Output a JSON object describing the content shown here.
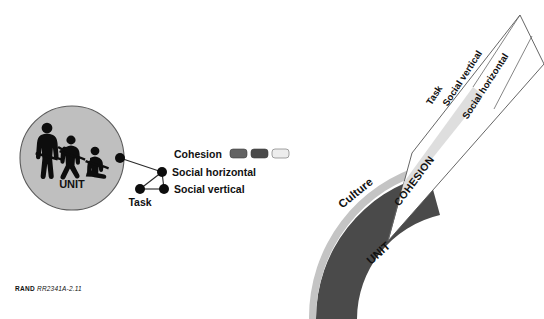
{
  "figure": {
    "caption_prefix": "RAND",
    "caption_id": "RR2341A-2.11"
  },
  "left_panel": {
    "unit_circle": {
      "label": "UNIT",
      "fill_color": "#bfbfbf",
      "stroke_color": "#555555",
      "icons": [
        "soldier-standing-icon",
        "soldier-running-icon",
        "soldier-kneeling-icon"
      ]
    },
    "legend": {
      "title": "Cohesion",
      "swatches": [
        {
          "name": "task-swatch",
          "color": "#636363"
        },
        {
          "name": "social-vertical-swatch",
          "color": "#4a4a4a"
        },
        {
          "name": "social-horizontal-swatch",
          "color": "#ededed"
        }
      ]
    },
    "network": {
      "hub_label": "",
      "nodes": [
        {
          "name": "hub-node",
          "label": ""
        },
        {
          "name": "social-horizontal-node",
          "label": "Social horizontal"
        },
        {
          "name": "social-vertical-node",
          "label": "Social vertical"
        },
        {
          "name": "task-node",
          "label": "Task"
        }
      ],
      "node_color": "#111111",
      "edge_color": "#333333"
    }
  },
  "right_panel": {
    "arcs": [
      {
        "name": "culture-arc",
        "label": "Culture",
        "color": "#c4c4c4",
        "text_color": "#1a1a1a"
      },
      {
        "name": "unit-arc",
        "label": "UNIT",
        "color": "#4a4a4a",
        "text_color": "#ffffff"
      }
    ],
    "callout": {
      "label": "COHESION",
      "fill_color": "#ffffff",
      "stroke_color": "#555555",
      "base_band_color": "#d9d9d9",
      "bands": [
        {
          "name": "task-band",
          "label": "Task"
        },
        {
          "name": "social-vertical-band",
          "label": "Social vertical"
        },
        {
          "name": "social-horizontal-band",
          "label": "Social horizontal"
        }
      ]
    }
  }
}
